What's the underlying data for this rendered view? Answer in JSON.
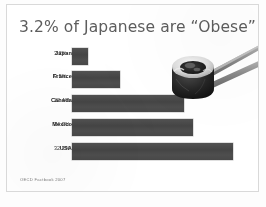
{
  "slide": {
    "title": "3.2% of Japanese are “Obese”",
    "source": "OECD Factbook 2007",
    "photo_name": "sushi-roll-held-by-chopsticks",
    "colors": {
      "background": "#ffffff",
      "title_text": "#5a5d61",
      "bar_fill": "#4a4a4a",
      "label_text": "#1c1c1c",
      "value_text": "#3a3a3a",
      "source_text": "#7d7d7d",
      "border": "#d6d9dc"
    }
  },
  "chart_data": {
    "type": "bar",
    "orientation": "horizontal",
    "title": "3.2% of Japanese are “Obese”",
    "xlabel": "",
    "ylabel": "",
    "categories": [
      "Japan",
      "France",
      "Canada",
      "Mexico",
      "USA"
    ],
    "values": [
      3.2,
      9.5,
      22.4,
      24.2,
      32.2
    ],
    "value_labels": [
      "3.2%",
      "9.5%",
      "22.4%",
      "24.2%",
      "32.2%"
    ],
    "unit": "%",
    "xlim": [
      0,
      36
    ],
    "grid": false,
    "legend": false,
    "annotations": [
      "OECD Factbook 2007"
    ]
  }
}
